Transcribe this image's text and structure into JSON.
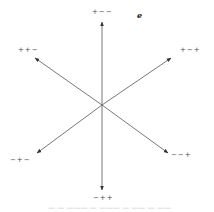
{
  "diagram": {
    "title_symbol": "e",
    "center": [
      102,
      105
    ],
    "arrows": [
      {
        "label": "+−−",
        "tip": [
          102,
          22
        ]
      },
      {
        "label": "+−+",
        "tip": [
          171,
          58
        ]
      },
      {
        "label": "−−+",
        "tip": [
          168,
          153
        ]
      },
      {
        "label": "−++",
        "tip": [
          102,
          190
        ]
      },
      {
        "label": "−+−",
        "tip": [
          37,
          153
        ]
      },
      {
        "label": "++−",
        "tip": [
          35,
          58
        ]
      }
    ],
    "stroke_color": "#555555"
  },
  "caption": "— — ——— — ——— — —— — ——"
}
